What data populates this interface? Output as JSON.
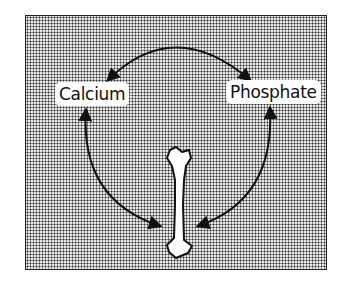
{
  "diagram": {
    "nodes": [
      {
        "id": "calcium",
        "label": "Calcium"
      },
      {
        "id": "phosphate",
        "label": "Phosphate"
      },
      {
        "id": "bone",
        "label": "",
        "icon": "bone-icon"
      }
    ],
    "edges": [
      {
        "from": "calcium",
        "to": "phosphate",
        "direction": "bidirectional"
      },
      {
        "from": "calcium",
        "to": "bone",
        "direction": "bidirectional"
      },
      {
        "from": "phosphate",
        "to": "bone",
        "direction": "bidirectional"
      }
    ],
    "colors": {
      "line": "#111111",
      "background_texture": "#333333",
      "label_bg": "#ffffff"
    }
  }
}
